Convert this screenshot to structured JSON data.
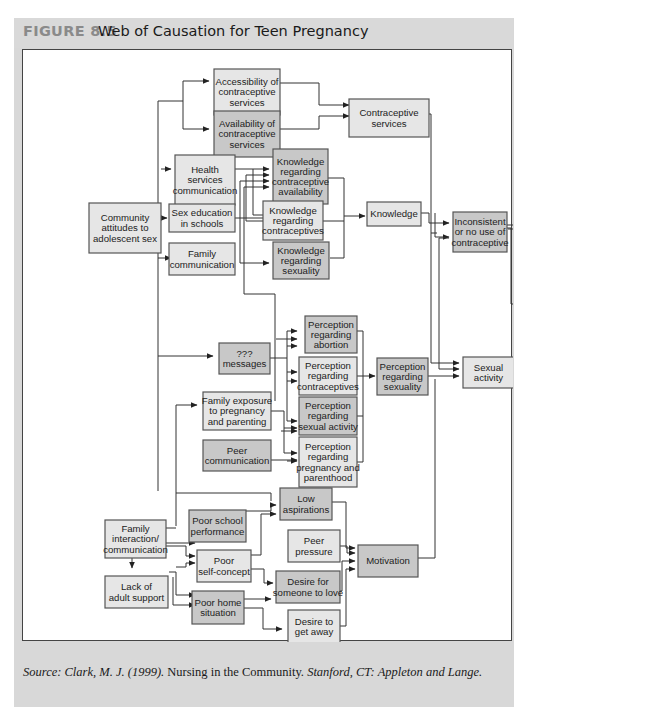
{
  "figure": {
    "label": "FIGURE 8.5",
    "title": "Web of Causation for Teen Pregnancy"
  },
  "source": {
    "prefix": "Source: Clark, M. J. (1999).",
    "book_title": " Nursing in the Community.",
    "publisher": " Stanford, CT: Appleton and Lange."
  },
  "colors": {
    "panel_bg": "#d8d8d8",
    "box_light": "#e6e6e6",
    "box_dark": "#c8c8c8",
    "box_border": "#555555",
    "line": "#333333",
    "label_gray": "#8a8a8a"
  },
  "nodes": [
    {
      "id": "community",
      "lines": [
        "Community",
        "attitudes to",
        "adolescent sex"
      ],
      "shade": "light"
    },
    {
      "id": "accessibility",
      "lines": [
        "Accessibility of",
        "contraceptive",
        "services"
      ],
      "shade": "light"
    },
    {
      "id": "availability",
      "lines": [
        "Availability of",
        "contraceptive",
        "services"
      ],
      "shade": "dark"
    },
    {
      "id": "contraceptive_services",
      "lines": [
        "Contraceptive",
        "services"
      ],
      "shade": "light"
    },
    {
      "id": "health_services",
      "lines": [
        "Health",
        "services",
        "communication"
      ],
      "shade": "light"
    },
    {
      "id": "sex_education",
      "lines": [
        "Sex education",
        "in schools"
      ],
      "shade": "light"
    },
    {
      "id": "family_comm",
      "lines": [
        "Family",
        "communication"
      ],
      "shade": "light"
    },
    {
      "id": "know_avail",
      "lines": [
        "Knowledge",
        "regarding",
        "contraceptive",
        "availability"
      ],
      "shade": "dark"
    },
    {
      "id": "know_contra",
      "lines": [
        "Knowledge",
        "regarding",
        "contraceptives"
      ],
      "shade": "light"
    },
    {
      "id": "know_sex",
      "lines": [
        "Knowledge",
        "regarding",
        "sexuality"
      ],
      "shade": "dark"
    },
    {
      "id": "knowledge",
      "lines": [
        "Knowledge"
      ],
      "shade": "light"
    },
    {
      "id": "inconsistent",
      "lines": [
        "Inconsistent",
        "or no use of",
        "contraceptive"
      ],
      "shade": "dark"
    },
    {
      "id": "adolescent_preg",
      "lines": [
        "Adolescent",
        "pregnancy"
      ],
      "shade": "dark"
    },
    {
      "id": "messages",
      "lines": [
        "???",
        "messages"
      ],
      "shade": "dark"
    },
    {
      "id": "perc_abortion",
      "lines": [
        "Perception",
        "regarding",
        "abortion"
      ],
      "shade": "dark"
    },
    {
      "id": "perc_contra",
      "lines": [
        "Perception",
        "regarding",
        "contraceptives"
      ],
      "shade": "light"
    },
    {
      "id": "perc_sexact",
      "lines": [
        "Perception",
        "regarding",
        "sexual activity"
      ],
      "shade": "dark"
    },
    {
      "id": "perc_preg",
      "lines": [
        "Perception",
        "regarding",
        "pregnancy and",
        "parenthood"
      ],
      "shade": "light"
    },
    {
      "id": "family_exposure",
      "lines": [
        "Family exposure",
        "to pregnancy",
        "and parenting"
      ],
      "shade": "light"
    },
    {
      "id": "peer_comm",
      "lines": [
        "Peer",
        "communication"
      ],
      "shade": "dark"
    },
    {
      "id": "perc_sexuality",
      "lines": [
        "Perception",
        "regarding",
        "sexuality"
      ],
      "shade": "dark"
    },
    {
      "id": "sexual_activity",
      "lines": [
        "Sexual",
        "activity"
      ],
      "shade": "light"
    },
    {
      "id": "low_aspirations",
      "lines": [
        "Low",
        "aspirations"
      ],
      "shade": "dark"
    },
    {
      "id": "poor_school",
      "lines": [
        "Poor school",
        "performance"
      ],
      "shade": "dark"
    },
    {
      "id": "peer_pressure",
      "lines": [
        "Peer",
        "pressure"
      ],
      "shade": "light"
    },
    {
      "id": "motivation",
      "lines": [
        "Motivation"
      ],
      "shade": "dark"
    },
    {
      "id": "family_interaction",
      "lines": [
        "Family",
        "interaction/",
        "communication"
      ],
      "shade": "light"
    },
    {
      "id": "poor_self",
      "lines": [
        "Poor",
        "self-concept"
      ],
      "shade": "light"
    },
    {
      "id": "desire_love",
      "lines": [
        "Desire for",
        "someone to love"
      ],
      "shade": "dark"
    },
    {
      "id": "lack_support",
      "lines": [
        "Lack of",
        "adult support"
      ],
      "shade": "light"
    },
    {
      "id": "poor_home",
      "lines": [
        "Poor home",
        "situation"
      ],
      "shade": "dark"
    },
    {
      "id": "desire_away",
      "lines": [
        "Desire to",
        "get away"
      ],
      "shade": "light"
    }
  ]
}
